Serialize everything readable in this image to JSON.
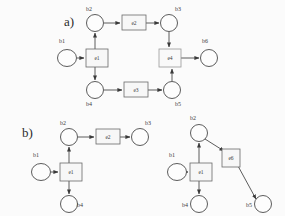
{
  "figure": {
    "panels": [
      {
        "id": "a",
        "label": "a)",
        "label_x": 64,
        "label_y": 26,
        "places": [
          {
            "name": "b1",
            "cx": 67,
            "cy": 58,
            "rx": 9.5,
            "ry": 8.5,
            "label_x": 62,
            "label_y": 43
          },
          {
            "name": "b2",
            "cx": 95,
            "cy": 23,
            "rx": 8.5,
            "ry": 8.5,
            "label_x": 89,
            "label_y": 11
          },
          {
            "name": "b3",
            "cx": 169,
            "cy": 23,
            "rx": 8.5,
            "ry": 8.5,
            "label_x": 178,
            "label_y": 11
          },
          {
            "name": "b4",
            "cx": 95,
            "cy": 90,
            "rx": 8.5,
            "ry": 8.5,
            "label_x": 89,
            "label_y": 106
          },
          {
            "name": "b5",
            "cx": 172,
            "cy": 90,
            "rx": 8.5,
            "ry": 8.5,
            "label_x": 178,
            "label_y": 106
          },
          {
            "name": "b6",
            "cx": 209,
            "cy": 58,
            "rx": 8.5,
            "ry": 8.5,
            "label_x": 205,
            "label_y": 43
          }
        ],
        "transitions": [
          {
            "name": "e1",
            "x": 86,
            "y": 49,
            "w": 22,
            "h": 18,
            "style": "solid"
          },
          {
            "name": "e2",
            "x": 122,
            "y": 15,
            "w": 24,
            "h": 15,
            "style": "solid"
          },
          {
            "name": "e3",
            "x": 124,
            "y": 82,
            "w": 24,
            "h": 15,
            "style": "solid"
          },
          {
            "name": "e4",
            "x": 159,
            "y": 49,
            "w": 22,
            "h": 18,
            "style": "faint"
          }
        ],
        "arcs": [
          {
            "from": "b1",
            "to": "e1",
            "path": "M 77 58 L 84 58"
          },
          {
            "from": "e1",
            "to": "b2",
            "path": "M 95 49 L 95 33"
          },
          {
            "from": "e1",
            "to": "b4",
            "path": "M 95 67 L 95 80"
          },
          {
            "from": "b2",
            "to": "e2",
            "path": "M 104 23 L 120 23"
          },
          {
            "from": "e2",
            "to": "b3",
            "path": "M 146 23 L 159 23"
          },
          {
            "from": "b4",
            "to": "e3",
            "path": "M 104 90 L 122 90"
          },
          {
            "from": "e3",
            "to": "b5",
            "path": "M 148 90 L 162 90"
          },
          {
            "from": "b3",
            "to": "e4",
            "path": "M 169 32 L 169 47"
          },
          {
            "from": "b5",
            "to": "e4",
            "path": "M 172 81 L 172 69"
          },
          {
            "from": "e4",
            "to": "b6",
            "path": "M 181 58 L 199 58"
          }
        ]
      },
      {
        "id": "b-left",
        "label": "b)",
        "label_x": 22,
        "label_y": 137,
        "places": [
          {
            "name": "b1",
            "cx": 41,
            "cy": 172,
            "rx": 9.5,
            "ry": 8.5,
            "label_x": 36,
            "label_y": 157
          },
          {
            "name": "b2",
            "cx": 69,
            "cy": 137,
            "rx": 8.5,
            "ry": 8.5,
            "label_x": 63,
            "label_y": 125
          },
          {
            "name": "b3",
            "cx": 140,
            "cy": 137,
            "rx": 8.5,
            "ry": 8.5,
            "label_x": 148,
            "label_y": 125
          },
          {
            "name": "b4",
            "cx": 69,
            "cy": 204,
            "rx": 8.5,
            "ry": 8.5,
            "label_x": 80,
            "label_y": 207
          }
        ],
        "transitions": [
          {
            "name": "e1",
            "x": 60,
            "y": 163,
            "w": 22,
            "h": 18,
            "style": "solid"
          },
          {
            "name": "e2",
            "x": 96,
            "y": 129,
            "w": 24,
            "h": 15,
            "style": "solid"
          }
        ],
        "arcs": [
          {
            "from": "b1",
            "to": "e1",
            "path": "M 51 172 L 58 172"
          },
          {
            "from": "e1",
            "to": "b2",
            "path": "M 69 163 L 69 147"
          },
          {
            "from": "e1",
            "to": "b4",
            "path": "M 69 181 L 69 194"
          },
          {
            "from": "b2",
            "to": "e2",
            "path": "M 78 137 L 94 137"
          },
          {
            "from": "e2",
            "to": "b3",
            "path": "M 120 137 L 130 137"
          }
        ]
      },
      {
        "id": "b-right",
        "label": "",
        "label_x": 0,
        "label_y": 0,
        "places": [
          {
            "name": "b1",
            "cx": 177,
            "cy": 172,
            "rx": 9.5,
            "ry": 8.5,
            "label_x": 172,
            "label_y": 157
          },
          {
            "name": "b2",
            "cx": 199,
            "cy": 133,
            "rx": 8.5,
            "ry": 8.5,
            "label_x": 193,
            "label_y": 120
          },
          {
            "name": "b4",
            "cx": 199,
            "cy": 204,
            "rx": 8.5,
            "ry": 8.5,
            "label_x": 185,
            "label_y": 207
          },
          {
            "name": "b5",
            "cx": 263,
            "cy": 204,
            "rx": 8.5,
            "ry": 8.5,
            "label_x": 249,
            "label_y": 207
          }
        ],
        "transitions": [
          {
            "name": "e1",
            "x": 190,
            "y": 163,
            "w": 22,
            "h": 18,
            "style": "solid"
          },
          {
            "name": "e6",
            "x": 222,
            "y": 149,
            "w": 18,
            "h": 18,
            "style": "solid"
          }
        ],
        "arcs": [
          {
            "from": "b1",
            "to": "e1",
            "path": "M 187 172 L 188 172"
          },
          {
            "from": "e1",
            "to": "b2",
            "path": "M 199 163 L 199 143"
          },
          {
            "from": "e1",
            "to": "b4",
            "path": "M 199 181 L 199 194"
          },
          {
            "from": "b2",
            "to": "e6",
            "path": "M 205 139 L 224 151"
          },
          {
            "from": "e6",
            "to": "b5",
            "path": "M 238 166 L 256 199"
          }
        ]
      }
    ],
    "caption": ""
  }
}
